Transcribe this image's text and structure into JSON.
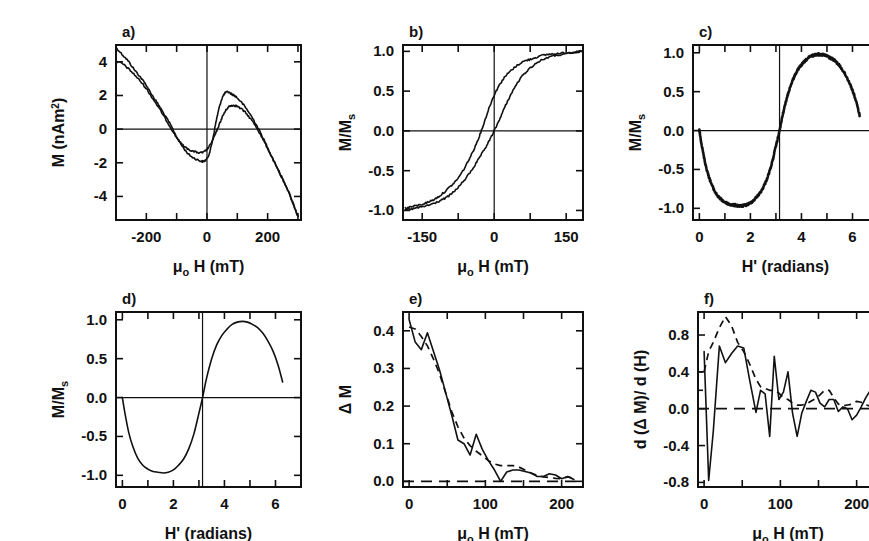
{
  "figure": {
    "caption": "",
    "background": "#ffffff",
    "ink": "#111111",
    "panel_count": 6
  },
  "chart_data": [
    {
      "id": "panel-a",
      "type": "line",
      "panel_label": "a)",
      "title": "",
      "xlabel": "μₒ H (mT)",
      "ylabel": "M (nAm²)",
      "xlim": [
        -300,
        310
      ],
      "ylim": [
        -5.4,
        5.0
      ],
      "xticks": [
        -300,
        -200,
        -100,
        0,
        100,
        200,
        300
      ],
      "xticklabels": [
        "",
        "-200",
        "",
        "0",
        "",
        "200",
        ""
      ],
      "yticks": [
        -4,
        -2,
        0,
        2,
        4
      ],
      "yticklabels": [
        "-4",
        "-2",
        "0",
        "2",
        "4"
      ],
      "grid": false,
      "zero_lines": [
        "x=0",
        "y=0"
      ],
      "legend": null,
      "series": [
        {
          "name": "descending branch",
          "style": "solid",
          "x": [
            -300,
            -280,
            -260,
            -240,
            -220,
            -200,
            -180,
            -160,
            -140,
            -120,
            -100,
            -80,
            -60,
            -40,
            -20,
            -10,
            0,
            10,
            20,
            30,
            40,
            50,
            60,
            70,
            80,
            90,
            100,
            120,
            140,
            160,
            180,
            200,
            220,
            240,
            260,
            280,
            300
          ],
          "y": [
            4.85,
            4.45,
            4.05,
            3.55,
            3.1,
            2.6,
            2.0,
            1.45,
            0.85,
            0.25,
            -0.45,
            -1.05,
            -1.5,
            -1.75,
            -1.9,
            -1.9,
            -1.75,
            -1.3,
            -0.5,
            0.45,
            1.25,
            1.85,
            2.15,
            2.2,
            2.1,
            2.0,
            1.85,
            1.45,
            0.95,
            0.35,
            -0.35,
            -1.1,
            -1.85,
            -2.6,
            -3.35,
            -4.2,
            -5.2
          ]
        },
        {
          "name": "ascending branch",
          "style": "solid",
          "x": [
            -300,
            -280,
            -260,
            -240,
            -220,
            -200,
            -180,
            -160,
            -140,
            -120,
            -100,
            -80,
            -60,
            -40,
            -20,
            -10,
            0,
            10,
            20,
            30,
            40,
            50,
            60,
            70,
            80,
            90,
            100,
            120,
            140,
            160,
            180,
            200,
            220,
            240,
            260,
            280,
            300
          ],
          "y": [
            4.0,
            3.9,
            3.6,
            3.25,
            2.85,
            2.4,
            1.85,
            1.3,
            0.7,
            0.1,
            -0.5,
            -0.95,
            -1.2,
            -1.35,
            -1.4,
            -1.35,
            -1.2,
            -0.95,
            -0.6,
            -0.2,
            0.25,
            0.7,
            1.05,
            1.3,
            1.4,
            1.4,
            1.35,
            1.1,
            0.7,
            0.2,
            -0.45,
            -1.15,
            -1.9,
            -2.65,
            -3.4,
            -4.25,
            -5.2
          ]
        }
      ]
    },
    {
      "id": "panel-b",
      "type": "line",
      "panel_label": "b)",
      "title": "",
      "xlabel": "μₒ H (mT)",
      "ylabel": "M/Mₛ",
      "xlim": [
        -190,
        185
      ],
      "ylim": [
        -1.12,
        1.08
      ],
      "xticks": [
        -150,
        -75,
        0,
        75,
        150
      ],
      "xticklabels": [
        "-150",
        "",
        "0",
        "",
        "150"
      ],
      "yticks": [
        -1.0,
        -0.5,
        0.0,
        0.5,
        1.0
      ],
      "yticklabels": [
        "-1.0",
        "-0.5",
        "0.0",
        "0.5",
        "1.0"
      ],
      "grid": false,
      "zero_lines": [
        "x=0",
        "y=0"
      ],
      "legend": null,
      "series": [
        {
          "name": "upper branch",
          "style": "solid",
          "x": [
            -185,
            -170,
            -155,
            -140,
            -125,
            -110,
            -95,
            -80,
            -65,
            -50,
            -40,
            -30,
            -20,
            -10,
            0,
            10,
            20,
            30,
            45,
            60,
            75,
            90,
            110,
            130,
            150,
            170,
            182
          ],
          "y": [
            -0.97,
            -0.95,
            -0.93,
            -0.9,
            -0.86,
            -0.8,
            -0.72,
            -0.63,
            -0.5,
            -0.33,
            -0.2,
            -0.05,
            0.12,
            0.3,
            0.45,
            0.57,
            0.66,
            0.73,
            0.81,
            0.87,
            0.9,
            0.93,
            0.96,
            0.97,
            0.98,
            0.99,
            1.0
          ]
        },
        {
          "name": "lower branch",
          "style": "solid",
          "x": [
            -185,
            -170,
            -155,
            -140,
            -125,
            -110,
            -95,
            -80,
            -65,
            -50,
            -40,
            -30,
            -20,
            -10,
            0,
            10,
            20,
            30,
            45,
            60,
            75,
            90,
            110,
            130,
            150,
            170,
            182
          ],
          "y": [
            -0.99,
            -0.98,
            -0.96,
            -0.94,
            -0.91,
            -0.87,
            -0.82,
            -0.74,
            -0.64,
            -0.52,
            -0.43,
            -0.33,
            -0.23,
            -0.12,
            0.0,
            0.13,
            0.27,
            0.4,
            0.57,
            0.7,
            0.79,
            0.86,
            0.92,
            0.95,
            0.97,
            0.99,
            1.0
          ]
        }
      ]
    },
    {
      "id": "panel-c",
      "type": "line",
      "panel_label": "c)",
      "title": "",
      "xlabel": "H' (radians)",
      "ylabel": "M/Mₛ",
      "xlim": [
        -0.25,
        7.0
      ],
      "ylim": [
        -1.15,
        1.1
      ],
      "xticks": [
        0,
        1,
        2,
        3,
        4,
        5,
        6,
        7
      ],
      "xticklabels": [
        "0",
        "",
        "2",
        "",
        "4",
        "",
        "6",
        ""
      ],
      "yticks": [
        -1.0,
        -0.5,
        0.0,
        0.5,
        1.0
      ],
      "yticklabels": [
        "-1.0",
        "-0.5",
        "0.0",
        "0.5",
        "1.0"
      ],
      "grid": false,
      "zero_lines": [
        "x=pi",
        "y=0"
      ],
      "noisy": true,
      "legend": null,
      "series": [
        {
          "name": "measured M/Ms vs H'",
          "style": "solid-thick-noisy",
          "x": [
            0.0,
            0.1,
            0.25,
            0.4,
            0.6,
            0.8,
            1.0,
            1.2,
            1.4,
            1.6,
            1.8,
            2.0,
            2.2,
            2.4,
            2.6,
            2.8,
            3.0,
            3.142,
            3.3,
            3.5,
            3.7,
            3.9,
            4.1,
            4.3,
            4.5,
            4.7,
            4.9,
            5.1,
            5.3,
            5.5,
            5.7,
            5.9,
            6.1,
            6.28
          ],
          "y": [
            0.0,
            -0.2,
            -0.45,
            -0.62,
            -0.78,
            -0.87,
            -0.92,
            -0.95,
            -0.96,
            -0.97,
            -0.96,
            -0.93,
            -0.87,
            -0.79,
            -0.66,
            -0.47,
            -0.2,
            0.0,
            0.25,
            0.5,
            0.68,
            0.8,
            0.88,
            0.94,
            0.97,
            0.98,
            0.97,
            0.94,
            0.9,
            0.83,
            0.73,
            0.6,
            0.42,
            0.2
          ]
        }
      ]
    },
    {
      "id": "panel-d",
      "type": "line",
      "panel_label": "d)",
      "title": "",
      "xlabel": "H' (radians)",
      "ylabel": "M/Mₛ",
      "xlim": [
        -0.25,
        7.0
      ],
      "ylim": [
        -1.15,
        1.1
      ],
      "xticks": [
        0,
        1,
        2,
        3,
        4,
        5,
        6,
        7
      ],
      "xticklabels": [
        "0",
        "",
        "2",
        "",
        "4",
        "",
        "6",
        ""
      ],
      "yticks": [
        -1.0,
        -0.5,
        0.0,
        0.5,
        1.0
      ],
      "yticklabels": [
        "-1.0",
        "-0.5",
        "0.0",
        "0.5",
        "1.0"
      ],
      "grid": false,
      "zero_lines": [
        "x=pi",
        "y=0"
      ],
      "noisy": false,
      "legend": null,
      "series": [
        {
          "name": "fitted M/Ms vs H'",
          "style": "solid",
          "x": [
            0.0,
            0.1,
            0.25,
            0.4,
            0.6,
            0.8,
            1.0,
            1.2,
            1.4,
            1.6,
            1.8,
            2.0,
            2.2,
            2.4,
            2.6,
            2.8,
            3.0,
            3.142,
            3.3,
            3.5,
            3.7,
            3.9,
            4.1,
            4.3,
            4.5,
            4.7,
            4.9,
            5.1,
            5.3,
            5.5,
            5.7,
            5.9,
            6.1,
            6.28
          ],
          "y": [
            0.0,
            -0.2,
            -0.45,
            -0.62,
            -0.78,
            -0.87,
            -0.92,
            -0.95,
            -0.96,
            -0.97,
            -0.96,
            -0.93,
            -0.87,
            -0.79,
            -0.66,
            -0.47,
            -0.2,
            0.0,
            0.25,
            0.5,
            0.68,
            0.8,
            0.88,
            0.94,
            0.97,
            0.98,
            0.97,
            0.94,
            0.9,
            0.83,
            0.73,
            0.6,
            0.42,
            0.2
          ]
        }
      ]
    },
    {
      "id": "panel-e",
      "type": "line",
      "panel_label": "e)",
      "title": "",
      "xlabel": "μₒ H (mT)",
      "ylabel": "Δ M",
      "xlim": [
        -8,
        228
      ],
      "ylim": [
        -0.015,
        0.45
      ],
      "xticks": [
        0,
        50,
        100,
        150,
        200
      ],
      "xticklabels": [
        "0",
        "",
        "100",
        "",
        "200"
      ],
      "yticks": [
        0.0,
        0.1,
        0.2,
        0.3,
        0.4
      ],
      "yticklabels": [
        "0.0",
        "0.1",
        "0.2",
        "0.3",
        "0.4"
      ],
      "grid": false,
      "zero_lines": [
        "y=0 dashed"
      ],
      "legend": null,
      "series": [
        {
          "name": "measured ΔM",
          "style": "solid",
          "x": [
            0,
            8,
            16,
            24,
            32,
            40,
            48,
            56,
            64,
            72,
            80,
            88,
            96,
            104,
            112,
            120,
            128,
            136,
            144,
            152,
            160,
            168,
            176,
            184,
            192,
            200,
            208,
            216
          ],
          "y": [
            0.43,
            0.37,
            0.35,
            0.395,
            0.345,
            0.295,
            0.235,
            0.175,
            0.11,
            0.1,
            0.07,
            0.125,
            0.085,
            0.055,
            0.03,
            0.0,
            0.025,
            0.03,
            0.03,
            0.026,
            0.022,
            0.013,
            0.013,
            0.02,
            0.017,
            0.007,
            0.013,
            0.005
          ]
        },
        {
          "name": "fitted ΔM",
          "style": "dashed",
          "x": [
            0,
            8,
            16,
            24,
            32,
            40,
            48,
            56,
            64,
            72,
            80,
            88,
            96,
            104,
            112,
            120,
            128,
            136,
            144,
            152,
            160,
            168,
            176,
            184,
            192,
            200,
            208,
            216
          ],
          "y": [
            0.41,
            0.405,
            0.385,
            0.36,
            0.325,
            0.285,
            0.235,
            0.185,
            0.145,
            0.115,
            0.095,
            0.08,
            0.068,
            0.055,
            0.046,
            0.042,
            0.042,
            0.042,
            0.038,
            0.03,
            0.022,
            0.016,
            0.012,
            0.01,
            0.008,
            0.007,
            0.012,
            0.008
          ]
        }
      ]
    },
    {
      "id": "panel-f",
      "type": "line",
      "panel_label": "f)",
      "title": "",
      "xlabel": "μₒ H (mT)",
      "ylabel": "d (Δ M)/ d (H)",
      "xlim": [
        -8,
        228
      ],
      "ylim": [
        -0.85,
        1.05
      ],
      "xticks": [
        0,
        50,
        100,
        150,
        200
      ],
      "xticklabels": [
        "0",
        "",
        "100",
        "",
        "200"
      ],
      "yticks": [
        -0.8,
        -0.4,
        0.0,
        0.4,
        0.8
      ],
      "yticklabels": [
        "-0.8",
        "-0.4",
        "0.0",
        "0.4",
        "0.8"
      ],
      "grid": false,
      "zero_lines": [
        "y=0 dashed"
      ],
      "legend": null,
      "series": [
        {
          "name": "measured d(ΔM)/d(H)",
          "style": "solid",
          "x": [
            0,
            6,
            12,
            20,
            28,
            36,
            44,
            52,
            60,
            68,
            74,
            80,
            86,
            92,
            98,
            104,
            110,
            116,
            122,
            128,
            134,
            140,
            146,
            152,
            158,
            164,
            170,
            176,
            182,
            188,
            194,
            200,
            206,
            212,
            218
          ],
          "y": [
            0.62,
            -0.78,
            -0.25,
            0.68,
            0.5,
            0.6,
            0.68,
            0.66,
            0.3,
            -0.04,
            0.2,
            0.16,
            -0.3,
            0.57,
            0.1,
            0.18,
            0.4,
            -0.05,
            -0.3,
            -0.05,
            0.08,
            0.2,
            0.18,
            0.06,
            0.02,
            0.1,
            0.1,
            -0.03,
            0.02,
            0.0,
            -0.12,
            -0.07,
            0.02,
            0.12,
            0.2
          ]
        },
        {
          "name": "fitted d(ΔM)/d(H)",
          "style": "dashed",
          "x": [
            0,
            6,
            12,
            20,
            28,
            36,
            44,
            52,
            60,
            68,
            74,
            80,
            86,
            92,
            98,
            104,
            110,
            116,
            122,
            128,
            134,
            140,
            146,
            152,
            158,
            164,
            170,
            176,
            182,
            188,
            194,
            200,
            206,
            212,
            218
          ],
          "y": [
            0.4,
            0.62,
            0.72,
            0.88,
            1.0,
            0.9,
            0.72,
            0.62,
            0.48,
            0.32,
            0.24,
            0.22,
            0.2,
            0.2,
            0.17,
            0.12,
            0.1,
            0.06,
            0.04,
            0.04,
            0.05,
            0.08,
            0.11,
            0.15,
            0.2,
            0.2,
            0.12,
            0.05,
            0.03,
            0.04,
            0.05,
            0.08,
            0.07,
            0.04,
            0.03
          ]
        }
      ]
    }
  ]
}
